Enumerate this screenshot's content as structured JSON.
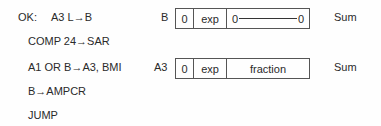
{
  "code_lines": [
    {
      "label": "OK:",
      "text": "A3 L→B"
    },
    {
      "text": "COMP 24→SAR"
    },
    {
      "text": "A1 OR B→A3, BMI"
    },
    {
      "text": "B→AMPCR"
    },
    {
      "text": "JUMP"
    }
  ],
  "registers": [
    {
      "name": "B",
      "cells": [
        "0",
        "exp",
        "0",
        "0"
      ],
      "annotation": "Sum"
    },
    {
      "name": "A3",
      "cells": [
        "0",
        "exp",
        "fraction"
      ],
      "annotation": "Sum"
    }
  ]
}
